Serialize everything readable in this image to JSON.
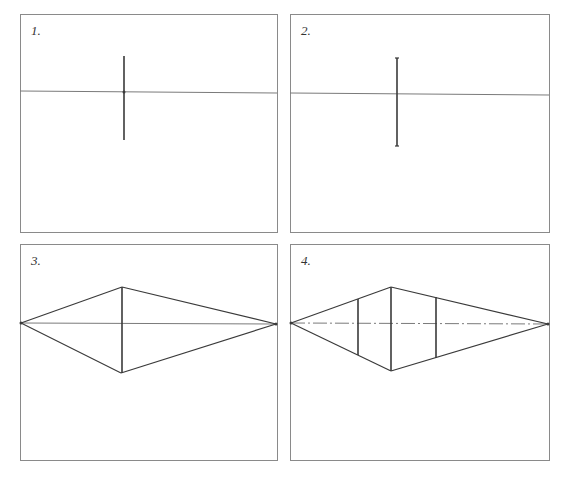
{
  "figure": {
    "panels": [
      {
        "label": "1.",
        "box": {
          "x": 20,
          "y": 14,
          "w": 258,
          "h": 219
        },
        "horizon": {
          "x1": 20,
          "y1": 91,
          "x2": 277,
          "y2": 93
        },
        "verticals": [
          {
            "x": 124,
            "y1": 56,
            "y2": 140
          }
        ]
      },
      {
        "label": "2.",
        "box": {
          "x": 290,
          "y": 14,
          "w": 260,
          "h": 219
        },
        "horizon": {
          "x1": 290,
          "y1": 93,
          "x2": 549,
          "y2": 95
        },
        "verticals": [
          {
            "x": 397,
            "y1": 58,
            "y2": 146,
            "endcaps": true
          }
        ]
      },
      {
        "label": "3.",
        "box": {
          "x": 20,
          "y": 244,
          "w": 258,
          "h": 217
        },
        "horizon": {
          "x1": 21,
          "y1": 323,
          "x2": 276,
          "y2": 324
        },
        "vanishing_points": [
          {
            "x": 21,
            "y": 323
          },
          {
            "x": 276,
            "y": 324
          }
        ],
        "verticals": [
          {
            "x": 122,
            "y1": 287,
            "y2": 373
          }
        ],
        "edges": [
          {
            "x1": 21,
            "y1": 323,
            "x2": 122,
            "y2": 287
          },
          {
            "x1": 122,
            "y1": 287,
            "x2": 276,
            "y2": 324
          },
          {
            "x1": 21,
            "y1": 323,
            "x2": 121,
            "y2": 373
          },
          {
            "x1": 121,
            "y1": 373,
            "x2": 276,
            "y2": 324
          }
        ]
      },
      {
        "label": "4.",
        "box": {
          "x": 290,
          "y": 244,
          "w": 260,
          "h": 217
        },
        "horizon": {
          "x1": 291,
          "y1": 323,
          "x2": 548,
          "y2": 324,
          "style": "dash-dot"
        },
        "vanishing_points": [
          {
            "x": 291,
            "y": 323
          },
          {
            "x": 548,
            "y": 324
          }
        ],
        "verticals": [
          {
            "x": 358,
            "y1": 299,
            "y2": 355
          },
          {
            "x": 391,
            "y1": 287,
            "y2": 371
          },
          {
            "x": 436,
            "y1": 297,
            "y2": 358
          }
        ],
        "edges": [
          {
            "x1": 291,
            "y1": 323,
            "x2": 391,
            "y2": 287
          },
          {
            "x1": 391,
            "y1": 287,
            "x2": 548,
            "y2": 324
          },
          {
            "x1": 291,
            "y1": 323,
            "x2": 391,
            "y2": 371
          },
          {
            "x1": 391,
            "y1": 371,
            "x2": 548,
            "y2": 324
          }
        ]
      }
    ]
  },
  "colors": {
    "border": "#8a8a8a",
    "horizon": "#7a7a7a",
    "edge": "#3a3a3a",
    "label": "#333333"
  }
}
